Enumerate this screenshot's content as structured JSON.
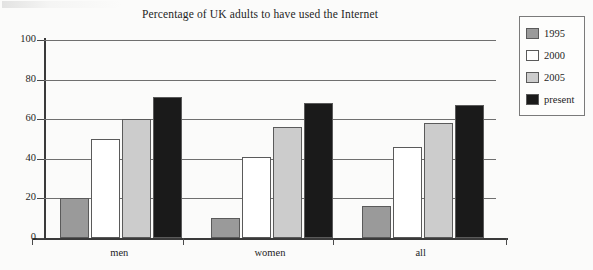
{
  "chart_data": {
    "type": "bar",
    "title": "Percentage of UK adults to have used the Internet",
    "xlabel": "",
    "ylabel": "",
    "categories": [
      "men",
      "women",
      "all"
    ],
    "series": [
      {
        "name": "1995",
        "values": [
          20,
          10,
          16
        ],
        "color": "#9a9a9a"
      },
      {
        "name": "2000",
        "values": [
          50,
          41,
          46
        ],
        "color": "#ffffff"
      },
      {
        "name": "2005",
        "values": [
          60,
          56,
          58
        ],
        "color": "#cccccc"
      },
      {
        "name": "present",
        "values": [
          71,
          68,
          67
        ],
        "color": "#1a1a1a"
      }
    ],
    "ylim": [
      0,
      100
    ],
    "yticks": [
      0,
      20,
      40,
      60,
      80,
      100
    ],
    "ytick_labels": [
      "0",
      "20",
      "40",
      "60",
      "80",
      "100"
    ],
    "grid": true,
    "legend_position": "top-right"
  },
  "legend": {
    "entries": [
      {
        "label": "1995"
      },
      {
        "label": "2000"
      },
      {
        "label": "2005"
      },
      {
        "label": "present"
      }
    ]
  }
}
